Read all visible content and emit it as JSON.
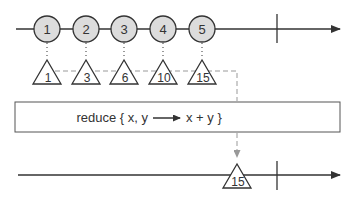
{
  "diagram": {
    "type": "marble-diagram",
    "operator_label": "reduce { x, y ⟶ x + y }",
    "operator_parts": {
      "prefix": "reduce { x, y",
      "arrow": "⟶",
      "suffix": "x + y }"
    },
    "input_stream": {
      "items": [
        {
          "value": "1",
          "x": 47
        },
        {
          "value": "2",
          "x": 86
        },
        {
          "value": "3",
          "x": 124
        },
        {
          "value": "4",
          "x": 163
        },
        {
          "value": "5",
          "x": 202
        }
      ],
      "completed": true
    },
    "intermediate_accumulations": [
      {
        "value": "1",
        "x": 47
      },
      {
        "value": "3",
        "x": 86
      },
      {
        "value": "6",
        "x": 124
      },
      {
        "value": "10",
        "x": 163
      },
      {
        "value": "15",
        "x": 202
      }
    ],
    "output_stream": {
      "items": [
        {
          "value": "15",
          "x": 237
        }
      ],
      "completed": true
    },
    "colors": {
      "line": "#333333",
      "circle_fill": "#dcdcdc",
      "dashed": "#999999",
      "box_stroke": "#555555"
    }
  }
}
